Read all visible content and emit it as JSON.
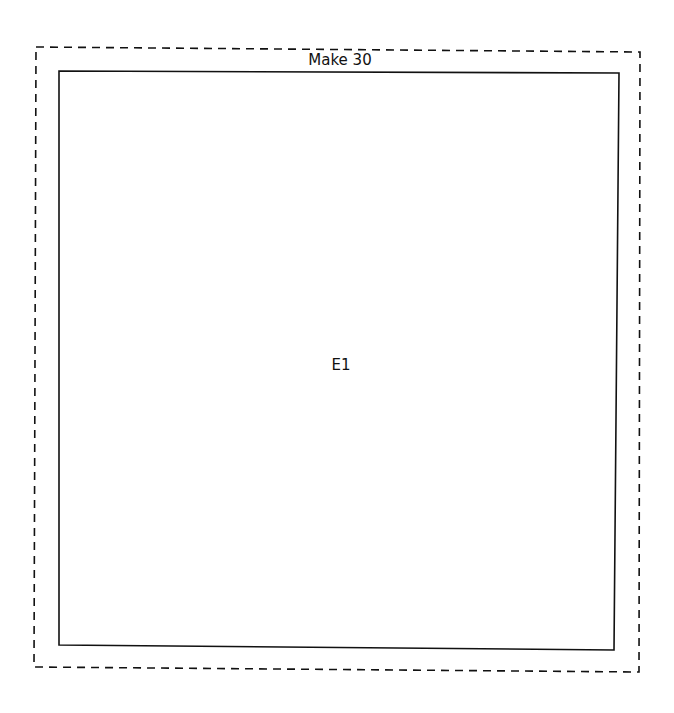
{
  "diagram": {
    "title": "Make 30",
    "boxes": [
      {
        "id": "outer",
        "style": "dashed",
        "label": "Make 30"
      },
      {
        "id": "inner",
        "style": "solid",
        "label": "E1"
      }
    ],
    "colors": {
      "stroke": "#111111",
      "background": "#ffffff"
    }
  }
}
